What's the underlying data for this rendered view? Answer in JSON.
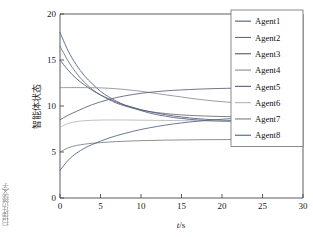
{
  "chart_data": {
    "type": "line",
    "title": "",
    "xlabel": "t/s",
    "xlabel_italic_part": "t",
    "xlabel_rest": "/s",
    "ylabel": "智能体状态",
    "xlim": [
      0,
      30
    ],
    "ylim": [
      0,
      20
    ],
    "xticks": [
      0,
      5,
      10,
      15,
      20,
      25,
      30
    ],
    "yticks": [
      0,
      5,
      10,
      15,
      20
    ],
    "grid": false,
    "legend_position": "upper right",
    "legend_entries": [
      "Agent1",
      "Agent2",
      "Agent3",
      "Agent4",
      "Agent5",
      "Agent6",
      "Agent7",
      "Agent8"
    ],
    "x": [
      0,
      1,
      2,
      3,
      4,
      5,
      6,
      7,
      8,
      9,
      10,
      11,
      12,
      13,
      14,
      15,
      16,
      17,
      18,
      19,
      20,
      21,
      21.7
    ],
    "series": [
      {
        "name": "Agent1",
        "color": "#4a5a8a",
        "values": [
          18.0,
          16.0,
          14.5,
          13.3,
          12.4,
          11.6,
          11.0,
          10.5,
          10.1,
          9.8,
          9.5,
          9.25,
          9.05,
          8.9,
          8.75,
          8.65,
          8.55,
          8.48,
          8.42,
          8.38,
          8.34,
          8.31,
          8.3
        ]
      },
      {
        "name": "Agent2",
        "color": "#6a6a6a",
        "values": [
          16.5,
          14.9,
          13.6,
          12.6,
          11.8,
          11.2,
          10.7,
          10.3,
          10.0,
          9.75,
          9.55,
          9.4,
          9.28,
          9.18,
          9.1,
          9.03,
          8.98,
          8.94,
          8.91,
          8.88,
          8.86,
          8.84,
          8.83
        ]
      },
      {
        "name": "Agent3",
        "color": "#555577",
        "values": [
          15.0,
          13.9,
          13.0,
          12.3,
          11.7,
          11.2,
          10.8,
          10.4,
          10.1,
          9.85,
          9.6,
          9.4,
          9.22,
          9.06,
          8.92,
          8.8,
          8.7,
          8.62,
          8.56,
          8.5,
          8.45,
          8.42,
          8.4
        ]
      },
      {
        "name": "Agent4",
        "color": "#8d8d8d",
        "values": [
          12.0,
          12.0,
          12.0,
          12.0,
          11.99,
          11.97,
          11.93,
          11.87,
          11.8,
          11.7,
          11.6,
          11.48,
          11.35,
          11.22,
          11.1,
          10.98,
          10.85,
          10.74,
          10.64,
          10.55,
          10.47,
          10.4,
          10.37
        ]
      },
      {
        "name": "Agent5",
        "color": "#5a5a82",
        "values": [
          8.5,
          9.0,
          9.4,
          9.8,
          10.15,
          10.45,
          10.7,
          10.92,
          11.1,
          11.25,
          11.38,
          11.48,
          11.57,
          11.64,
          11.7,
          11.75,
          11.79,
          11.83,
          11.86,
          11.89,
          11.91,
          11.93,
          11.94
        ]
      },
      {
        "name": "Agent6",
        "color": "#b4b4b4",
        "values": [
          7.7,
          8.1,
          8.3,
          8.4,
          8.45,
          8.47,
          8.48,
          8.48,
          8.48,
          8.47,
          8.46,
          8.45,
          8.44,
          8.43,
          8.42,
          8.41,
          8.4,
          8.39,
          8.38,
          8.37,
          8.36,
          8.35,
          8.35
        ]
      },
      {
        "name": "Agent7",
        "color": "#7b7b7b",
        "values": [
          5.0,
          5.45,
          5.7,
          5.85,
          5.95,
          6.02,
          6.08,
          6.13,
          6.17,
          6.2,
          6.23,
          6.25,
          6.27,
          6.29,
          6.3,
          6.31,
          6.32,
          6.33,
          6.34,
          6.34,
          6.35,
          6.35,
          6.36
        ]
      },
      {
        "name": "Agent8",
        "color": "#4f5f87",
        "values": [
          3.0,
          4.1,
          4.85,
          5.4,
          5.82,
          6.18,
          6.5,
          6.78,
          7.02,
          7.25,
          7.45,
          7.62,
          7.78,
          7.92,
          8.05,
          8.16,
          8.26,
          8.35,
          8.43,
          8.5,
          8.56,
          8.62,
          8.65
        ]
      }
    ],
    "long_flat_lines": [
      {
        "name": "Agent7-extension",
        "value": 6.36,
        "from_x": 21.7,
        "to_x": 30,
        "color": "#7b7b7b"
      }
    ]
  },
  "margin_artifact": {
    "text": "扫描件边缘文字"
  }
}
